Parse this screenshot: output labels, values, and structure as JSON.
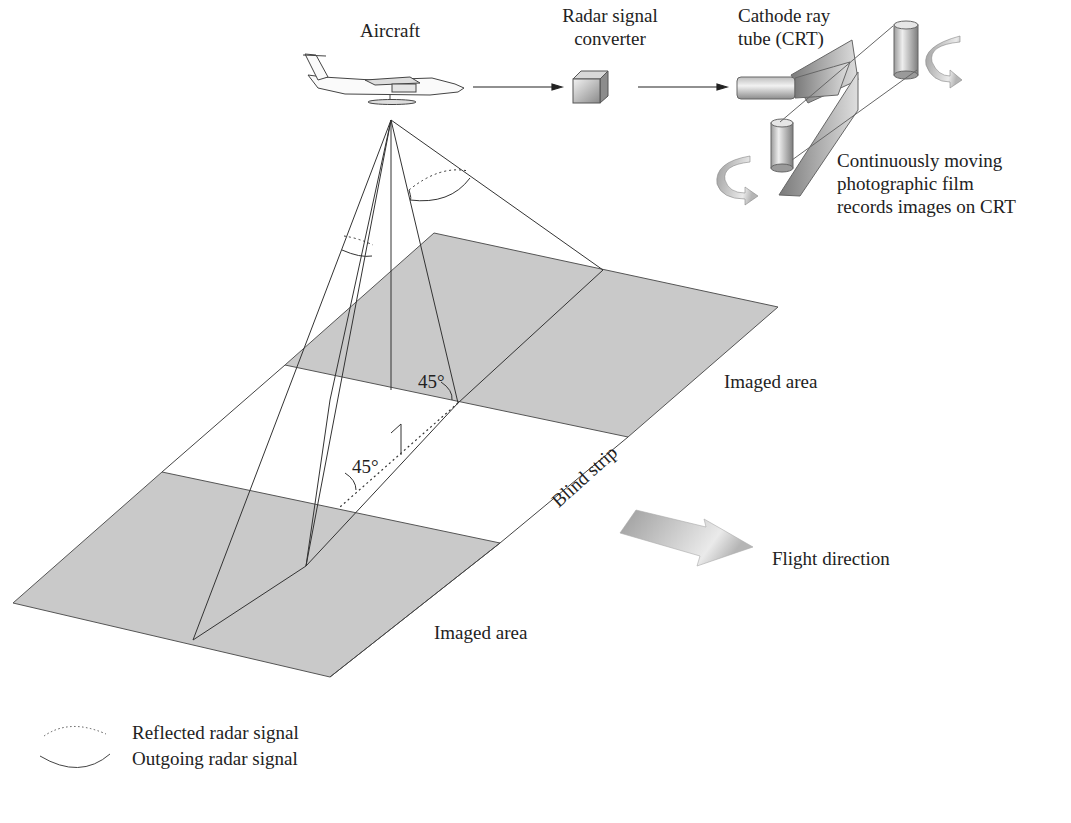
{
  "labels": {
    "aircraft": "Aircraft",
    "converter_line1": "Radar signal",
    "converter_line2": "converter",
    "crt_line1": "Cathode ray",
    "crt_line2": "tube (CRT)",
    "film_line1": "Continuously moving",
    "film_line2": "photographic film",
    "film_line3": "records images on CRT",
    "imaged_area_right": "Imaged area",
    "imaged_area_left": "Imaged area",
    "blind_strip": "Blind strip",
    "flight_direction": "Flight direction",
    "angle_upper": "45°",
    "angle_lower": "45°"
  },
  "legend": {
    "items": [
      {
        "icon": "dotted-arc",
        "label": "Reflected radar signal"
      },
      {
        "icon": "solid-arc",
        "label": "Outgoing radar signal"
      }
    ]
  },
  "colors": {
    "imaged_area_fill": "#c9c9c9",
    "line": "#333333",
    "arrow_fill": "#a8a8a8"
  }
}
